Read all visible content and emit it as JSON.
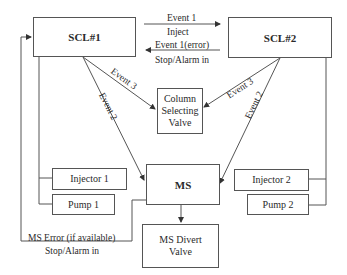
{
  "diagram": {
    "nodes": {
      "scl1": "SCL#1",
      "scl2": "SCL#2",
      "column_valve": "Column Selecting Valve",
      "column_valve_lines": [
        "Column",
        "Selecting",
        "Valve"
      ],
      "ms": "MS",
      "ms_divert": "MS Divert Valve",
      "ms_divert_lines": [
        "MS Divert",
        "Valve"
      ],
      "injector1": "Injector 1",
      "pump1": "Pump 1",
      "injector2": "Injector 2",
      "pump2": "Pump 2"
    },
    "edges": {
      "event1": "Event 1",
      "inject": "Inject",
      "event1_error": "Event 1(error)",
      "stop_alarm_top": "Stop/Alarm in",
      "event3_left": "Event 3",
      "event2_left": "Event 2",
      "event3_right": "Event 3",
      "event2_right": "Event 2",
      "ms_error": "MS Error (if available)",
      "stop_alarm_bottom": "Stop/Alarm in"
    },
    "colors": {
      "line": "#555555",
      "text": "#2a2a2a",
      "background": "#ffffff"
    }
  }
}
